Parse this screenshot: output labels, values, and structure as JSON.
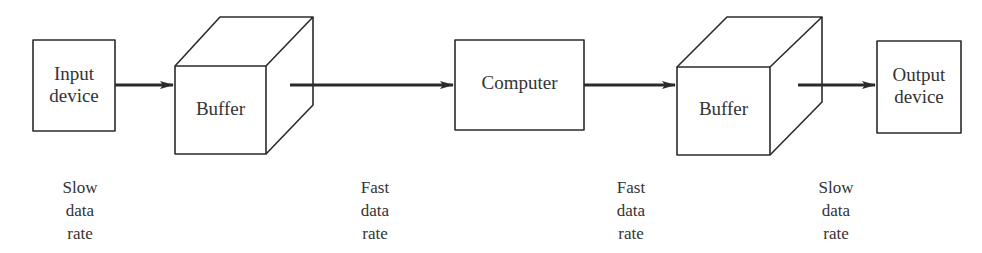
{
  "diagram": {
    "nodes": [
      {
        "id": "input",
        "type": "box",
        "line1": "Input",
        "line2": "device"
      },
      {
        "id": "buffer1",
        "type": "cube",
        "label": "Buffer"
      },
      {
        "id": "computer",
        "type": "box",
        "label": "Computer"
      },
      {
        "id": "buffer2",
        "type": "cube",
        "label": "Buffer"
      },
      {
        "id": "output",
        "type": "box",
        "line1": "Output",
        "line2": "device"
      }
    ],
    "edges": [
      {
        "from": "input",
        "to": "buffer1"
      },
      {
        "from": "buffer1",
        "to": "computer"
      },
      {
        "from": "computer",
        "to": "buffer2"
      },
      {
        "from": "buffer2",
        "to": "output"
      }
    ],
    "rate_labels": [
      {
        "line1": "Slow",
        "line2": "data",
        "line3": "rate"
      },
      {
        "line1": "Fast",
        "line2": "data",
        "line3": "rate"
      },
      {
        "line1": "Fast",
        "line2": "data",
        "line3": "rate"
      },
      {
        "line1": "Slow",
        "line2": "data",
        "line3": "rate"
      }
    ],
    "stroke_color": "#2b2b2b"
  }
}
